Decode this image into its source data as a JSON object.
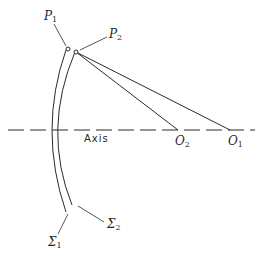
{
  "diagram": {
    "axis_label": "Axis",
    "points": {
      "P1": {
        "letter": "P",
        "sub": "1"
      },
      "P2": {
        "letter": "P",
        "sub": "2"
      },
      "O1": {
        "letter": "O",
        "sub": "1"
      },
      "O2": {
        "letter": "O",
        "sub": "2"
      }
    },
    "surfaces": {
      "S1": {
        "letter": "Σ",
        "sub": "1"
      },
      "S2": {
        "letter": "Σ",
        "sub": "2"
      }
    },
    "colors": {
      "stroke": "#2a2a2a",
      "background": "#ffffff"
    }
  }
}
